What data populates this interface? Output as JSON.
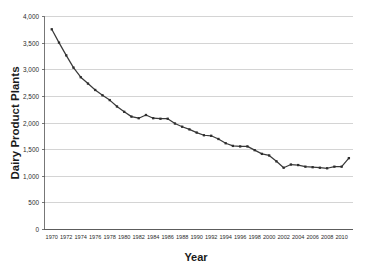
{
  "chart_data": {
    "type": "line",
    "title": "",
    "xlabel": "Year",
    "ylabel": "Dairy Product Plants",
    "xlim": [
      1969,
      2011.5
    ],
    "ylim": [
      0,
      4000
    ],
    "grid": true,
    "legend": false,
    "legend_position": "none",
    "line_color": "#3a3a3a",
    "marker": "square",
    "marker_color": "#2e2e2e",
    "gridline_color": "#b8b8b8",
    "background_color": "#ffffff",
    "x_tick_labels": [
      "1970",
      "1972",
      "1974",
      "1976",
      "1978",
      "1980",
      "1982",
      "1984",
      "1986",
      "1988",
      "1990",
      "1992",
      "1994",
      "1996",
      "1998",
      "2000",
      "2002",
      "2004",
      "2006",
      "2008",
      "2010"
    ],
    "y_tick_labels": [
      "0",
      "500",
      "1,000",
      "1,500",
      "2,000",
      "2,500",
      "3,000",
      "3,500",
      "4,000"
    ],
    "y_ticks": [
      0,
      500,
      1000,
      1500,
      2000,
      2500,
      3000,
      3500,
      4000
    ],
    "x": [
      1970,
      1971,
      1972,
      1973,
      1974,
      1975,
      1976,
      1977,
      1978,
      1979,
      1980,
      1981,
      1982,
      1983,
      1984,
      1985,
      1986,
      1987,
      1988,
      1989,
      1990,
      1991,
      1992,
      1993,
      1994,
      1995,
      1996,
      1997,
      1998,
      1999,
      2000,
      2001,
      2002,
      2003,
      2004,
      2005,
      2006,
      2007,
      2008,
      2009,
      2010,
      2011
    ],
    "values": [
      3760,
      3510,
      3270,
      3040,
      2860,
      2740,
      2620,
      2520,
      2430,
      2310,
      2210,
      2120,
      2090,
      2150,
      2090,
      2080,
      2080,
      1990,
      1930,
      1880,
      1820,
      1770,
      1760,
      1700,
      1620,
      1570,
      1560,
      1560,
      1490,
      1420,
      1390,
      1280,
      1160,
      1220,
      1210,
      1180,
      1170,
      1160,
      1150,
      1180,
      1180,
      1340
    ],
    "series": [
      {
        "name": "Dairy Product Plants",
        "values": [
          3760,
          3510,
          3270,
          3040,
          2860,
          2740,
          2620,
          2520,
          2430,
          2310,
          2210,
          2120,
          2090,
          2150,
          2090,
          2080,
          2080,
          1990,
          1930,
          1880,
          1820,
          1770,
          1760,
          1700,
          1620,
          1570,
          1560,
          1560,
          1490,
          1420,
          1390,
          1280,
          1160,
          1220,
          1210,
          1180,
          1170,
          1160,
          1150,
          1180,
          1180,
          1340
        ]
      }
    ]
  }
}
